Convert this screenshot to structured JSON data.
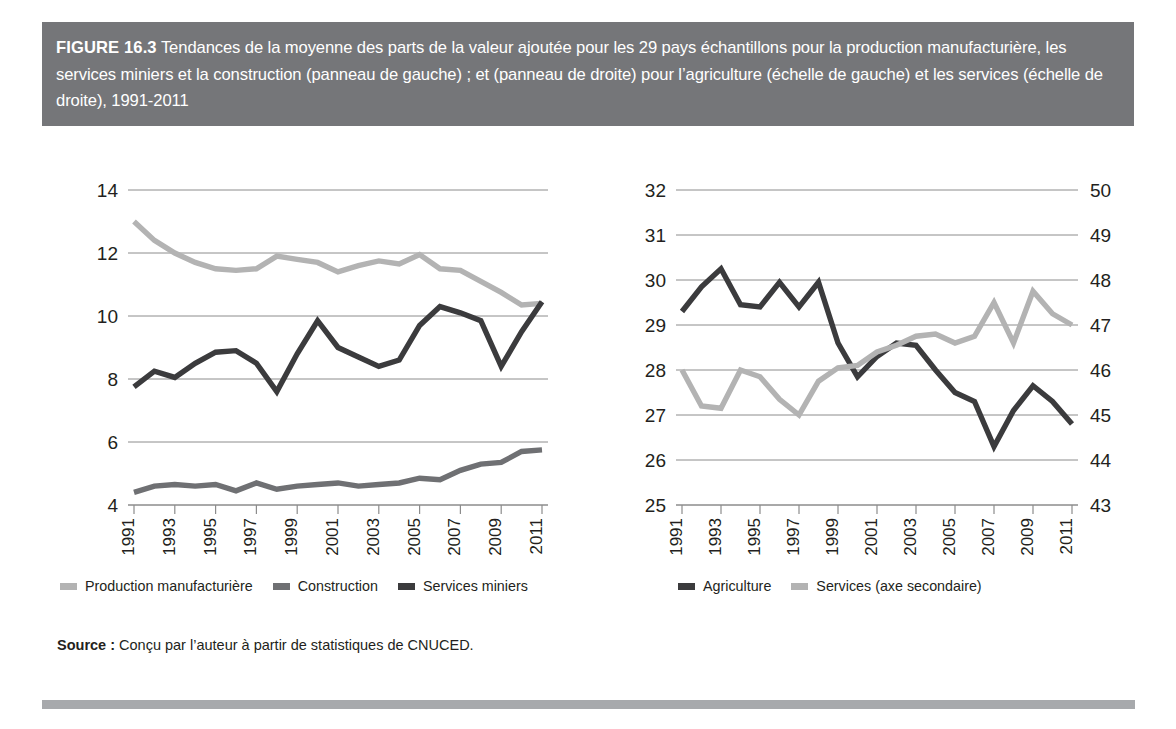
{
  "figure": {
    "label": "FIGURE 16.3",
    "caption": "Tendances de la moyenne des parts de la valeur ajoutée pour les 29 pays échantillons pour la production manufacturière, les services miniers et la construction (panneau de gauche) ; et (panneau de droite) pour l’agriculture (échelle de gauche) et les services (échelle de droite), 1991-2011"
  },
  "source": {
    "label": "Source :",
    "text": " Conçu par l’auteur à partir de statistiques de CNUCED."
  },
  "colors": {
    "title_bar": "#757679",
    "bottom_rule": "#a7a9ac",
    "light_gray": "#b3b3b3",
    "medium_gray": "#6f7073",
    "dark_gray": "#3b3b3d",
    "gridline": "#8c8c8c",
    "text": "#231f20"
  },
  "legend_left": [
    {
      "label": "Production manufacturière",
      "color": "#b3b3b3"
    },
    {
      "label": "Construction",
      "color": "#6f7073"
    },
    {
      "label": "Services miniers",
      "color": "#3b3b3d"
    }
  ],
  "legend_right": [
    {
      "label": "Agriculture",
      "color": "#3b3b3d"
    },
    {
      "label": "Services (axe secondaire)",
      "color": "#b3b3b3"
    }
  ],
  "chart_data": [
    {
      "id": "left-panel",
      "type": "line",
      "title": "",
      "xlabel": "",
      "ylabel": "",
      "grid": true,
      "legend_position": "bottom",
      "x": [
        1991,
        1992,
        1993,
        1994,
        1995,
        1996,
        1997,
        1998,
        1999,
        2000,
        2001,
        2002,
        2003,
        2004,
        2005,
        2006,
        2007,
        2008,
        2009,
        2010,
        2011
      ],
      "xticklabels": [
        "1991",
        "1993",
        "1995",
        "1997",
        "1999",
        "2001",
        "2003",
        "2005",
        "2007",
        "2009",
        "2011"
      ],
      "ylim": [
        4,
        14
      ],
      "yticks": [
        4,
        6,
        8,
        10,
        12,
        14
      ],
      "series": [
        {
          "name": "Production manufacturière",
          "color": "#b3b3b3",
          "values": [
            13.0,
            12.4,
            12.0,
            11.7,
            11.5,
            11.45,
            11.5,
            11.9,
            11.8,
            11.7,
            11.4,
            11.6,
            11.75,
            11.65,
            11.95,
            11.5,
            11.45,
            11.1,
            10.75,
            10.35,
            10.4
          ]
        },
        {
          "name": "Construction",
          "color": "#6f7073",
          "values": [
            4.4,
            4.6,
            4.65,
            4.6,
            4.65,
            4.45,
            4.7,
            4.5,
            4.6,
            4.65,
            4.7,
            4.6,
            4.65,
            4.7,
            4.85,
            4.8,
            5.1,
            5.3,
            5.35,
            5.7,
            5.75
          ]
        },
        {
          "name": "Services miniers",
          "color": "#3b3b3d",
          "values": [
            7.75,
            8.25,
            8.05,
            8.5,
            8.85,
            8.9,
            8.5,
            7.6,
            8.8,
            9.85,
            9.0,
            8.7,
            8.4,
            8.6,
            9.7,
            10.3,
            10.1,
            9.85,
            8.4,
            9.5,
            10.45
          ]
        }
      ]
    },
    {
      "id": "right-panel",
      "type": "line",
      "title": "",
      "xlabel": "",
      "ylabel": "",
      "grid": true,
      "legend_position": "bottom",
      "x": [
        1991,
        1992,
        1993,
        1994,
        1995,
        1996,
        1997,
        1998,
        1999,
        2000,
        2001,
        2002,
        2003,
        2004,
        2005,
        2006,
        2007,
        2008,
        2009,
        2010,
        2011
      ],
      "xticklabels": [
        "1991",
        "1993",
        "1995",
        "1997",
        "1999",
        "2001",
        "2003",
        "2005",
        "2007",
        "2009",
        "2011"
      ],
      "ylim": [
        25,
        32
      ],
      "yticks": [
        25,
        26,
        27,
        28,
        29,
        30,
        31,
        32
      ],
      "ylim_secondary": [
        43,
        50
      ],
      "yticks_secondary": [
        43,
        44,
        45,
        46,
        47,
        48,
        49,
        50
      ],
      "series": [
        {
          "name": "Agriculture",
          "color": "#3b3b3d",
          "axis": "left",
          "values": [
            29.3,
            29.85,
            30.25,
            29.45,
            29.4,
            29.95,
            29.4,
            29.95,
            28.6,
            27.85,
            28.3,
            28.6,
            28.55,
            28.0,
            27.5,
            27.3,
            26.3,
            27.1,
            27.65,
            27.3,
            26.8
          ]
        },
        {
          "name": "Services (axe secondaire)",
          "color": "#b3b3b3",
          "axis": "right",
          "values": [
            46.0,
            45.2,
            45.15,
            46.0,
            45.85,
            45.35,
            45.0,
            45.75,
            46.05,
            46.1,
            46.4,
            46.55,
            46.75,
            46.8,
            46.6,
            46.75,
            47.5,
            46.6,
            47.75,
            47.25,
            47.0
          ]
        }
      ]
    }
  ]
}
